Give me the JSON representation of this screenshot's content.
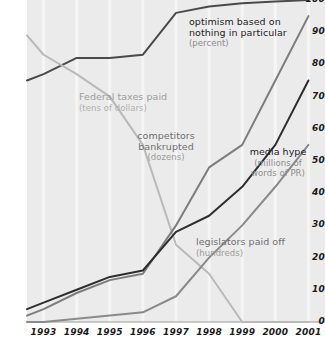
{
  "chart_data": {
    "type": "line",
    "title": "",
    "subtitle": "",
    "xlabel": "",
    "ylabel": "",
    "xlim": [
      1992.5,
      2001.5
    ],
    "ylim": [
      0,
      100
    ],
    "grid": true,
    "legend_position": "inline-annotations",
    "x_tick_labels": [
      "1993",
      "1994",
      "1995",
      "1996",
      "1997",
      "1998",
      "1999",
      "2000",
      "2001"
    ],
    "y_tick_labels": [
      "0",
      "10",
      "20",
      "30",
      "40",
      "50",
      "60",
      "70",
      "80",
      "90",
      "100"
    ],
    "x": [
      1992.5,
      1993,
      1994,
      1995,
      1996,
      1997,
      1998,
      1999,
      2000,
      2001
    ],
    "series": [
      {
        "name": "optimism based on nothing in particular",
        "unit": "(percent)",
        "color": "#4a4a4a",
        "values": [
          75,
          77,
          82,
          82,
          83,
          96,
          98,
          99,
          99.5,
          100
        ]
      },
      {
        "name": "Federal taxes paid",
        "unit": "(tens of dollars)",
        "color": "#b9b9b9",
        "values": [
          89,
          83,
          77,
          70,
          55,
          24,
          15,
          0,
          0,
          0
        ]
      },
      {
        "name": "competitors bankrupted",
        "unit": "(dozens)",
        "color": "#7d7d7d",
        "values": [
          2,
          4,
          9,
          13,
          15,
          30,
          48,
          55,
          75,
          95
        ]
      },
      {
        "name": "media hype",
        "unit": "(millions of words of PR)",
        "color": "#2e2e2e",
        "values": [
          4,
          6,
          10,
          14,
          16,
          28,
          33,
          42,
          55,
          75
        ]
      },
      {
        "name": "legislators paid off",
        "unit": "(hundreds)",
        "color": "#8a8a8a",
        "values": [
          0,
          0,
          1,
          2,
          3,
          8,
          20,
          30,
          42,
          55
        ]
      }
    ],
    "annotations": [
      {
        "id": "optimism",
        "name": "optimism based on",
        "name2": "nothing in particular",
        "unit": "(percent)",
        "tone": "dark"
      },
      {
        "id": "federal-taxes",
        "name": "Federal taxes paid",
        "unit": "(tens of dollars)",
        "tone": "light"
      },
      {
        "id": "competitors",
        "name": "competitors",
        "name2": "bankrupted",
        "unit": "(dozens)",
        "tone": "mid"
      },
      {
        "id": "media-hype",
        "name": "media hype",
        "unit": "(millions of",
        "unit2": "words of PR)",
        "tone": "dark"
      },
      {
        "id": "legislators",
        "name": "legislators paid off",
        "unit": "(hundreds)",
        "tone": "mid"
      }
    ],
    "colors": {
      "plot_background": "#ebebeb",
      "gridline": "#f5f5f5",
      "axis_line": "#9a9a9a",
      "tick_text": "#1b1b1b"
    }
  }
}
